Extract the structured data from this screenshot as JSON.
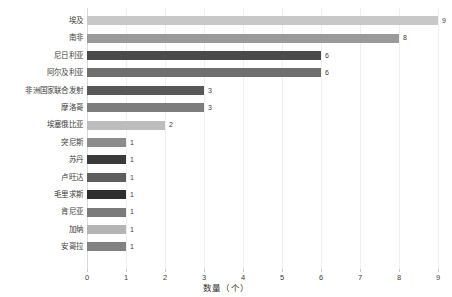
{
  "chart_data": {
    "type": "bar",
    "orientation": "horizontal",
    "title": "",
    "subtitle": "",
    "xlabel": "数量（个）",
    "ylabel": "",
    "xlim": [
      0,
      9
    ],
    "xticks": [
      0,
      1,
      2,
      3,
      4,
      5,
      6,
      7,
      8,
      9
    ],
    "xtick_labels": [
      "0",
      "1",
      "2",
      "3",
      "4",
      "5",
      "6",
      "7",
      "8",
      "9"
    ],
    "grid": true,
    "grid_axis": "x",
    "legend": false,
    "legend_position": "none",
    "categories": [
      "埃及",
      "南非",
      "尼日利亚",
      "阿尔及利亚",
      "非洲国家联合发射",
      "摩洛哥",
      "埃塞俄比亚",
      "突尼斯",
      "苏丹",
      "卢旺达",
      "毛里求斯",
      "肯尼亚",
      "加纳",
      "安哥拉"
    ],
    "values": [
      9,
      8,
      6,
      6,
      3,
      3,
      2,
      1,
      1,
      1,
      1,
      1,
      1,
      1
    ],
    "data_labels": [
      "9",
      "8",
      "6",
      "6",
      "3",
      "3",
      "2",
      "1",
      "1",
      "1",
      "1",
      "1",
      "1",
      "1"
    ],
    "bar_colors": [
      "#c8c8c8",
      "#9a9a9a",
      "#4a4a4a",
      "#6e6e6e",
      "#585858",
      "#7d7d7d",
      "#bdbdbd",
      "#8c8c8c",
      "#3a3a3a",
      "#5e5e5e",
      "#2f2f2f",
      "#7a7a7a",
      "#b4b4b4",
      "#828282"
    ],
    "grid_color": "#f0f0f0",
    "axis_color": "#d9d9d9",
    "text_color": "#3d3d3d",
    "background_color": "#ffffff"
  }
}
